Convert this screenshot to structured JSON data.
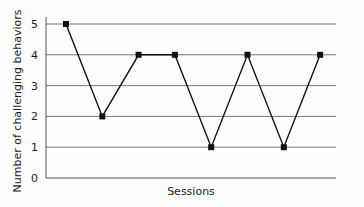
{
  "chart_data": {
    "type": "line",
    "title": "",
    "xlabel": "Sessions",
    "ylabel": "Number of challenging behaviors",
    "x": [
      1,
      2,
      3,
      4,
      5,
      6,
      7,
      8
    ],
    "series": [
      {
        "name": "Challenging behaviors",
        "values": [
          5,
          2,
          4,
          4,
          1,
          4,
          1,
          4
        ],
        "marker": "square",
        "color": "#111111"
      }
    ],
    "yticks": [
      0,
      1,
      2,
      3,
      4,
      5
    ],
    "ylim": [
      0,
      5
    ],
    "grid": true,
    "legend": null
  },
  "labels": {
    "xlabel": "Sessions",
    "ylabel": "Number of challenging behaviors",
    "yticks": [
      "0",
      "1",
      "2",
      "3",
      "4",
      "5"
    ]
  },
  "colors": {
    "grid": "#777777",
    "line": "#111111",
    "text": "#222222"
  }
}
